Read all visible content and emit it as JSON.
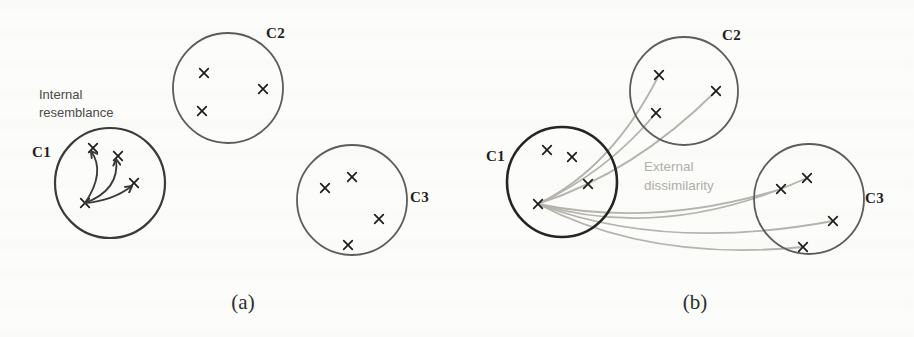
{
  "figure": {
    "background": "#fcfcfa",
    "mark_color": "#1c1c1c",
    "arrow_color": "#3a3a3a",
    "curve_color": "#b5b3ad",
    "panels": [
      {
        "id": "a",
        "caption": "(a)",
        "annotation": {
          "line1": "Internal",
          "line2": "resemblance"
        },
        "clusters": [
          {
            "label": "C1",
            "cx": 110,
            "cy": 183,
            "r": 55,
            "stroke": "#3a3a3a",
            "width": 2.2,
            "points": [
              [
                93,
                148
              ],
              [
                118,
                156
              ],
              [
                134,
                183
              ],
              [
                85,
                203
              ]
            ]
          },
          {
            "label": "C2",
            "cx": 228,
            "cy": 88,
            "r": 55,
            "stroke": "#5c5c5c",
            "width": 1.8,
            "points": [
              [
                204,
                73
              ],
              [
                263,
                89
              ],
              [
                202,
                111
              ]
            ]
          },
          {
            "label": "C3",
            "cx": 352,
            "cy": 200,
            "r": 55,
            "stroke": "#5c5c5c",
            "width": 1.8,
            "points": [
              [
                352,
                177
              ],
              [
                325,
                188
              ],
              [
                379,
                219
              ],
              [
                348,
                245
              ]
            ]
          }
        ],
        "arrows": {
          "from": [
            85,
            203
          ],
          "to": [
            {
              "end": [
                93,
                148
              ],
              "ctrl": [
                106,
                172
              ]
            },
            {
              "end": [
                118,
                156
              ],
              "ctrl": [
                120,
                190
              ]
            },
            {
              "end": [
                134,
                183
              ],
              "ctrl": [
                112,
                201
              ]
            }
          ]
        }
      },
      {
        "id": "b",
        "caption": "(b)",
        "annotation": {
          "line1": "External",
          "line2": "dissimilarity"
        },
        "clusters": [
          {
            "label": "C1",
            "cx": 562,
            "cy": 182,
            "r": 55,
            "stroke": "#252525",
            "width": 2.6,
            "points": [
              [
                547,
                150
              ],
              [
                572,
                157
              ],
              [
                588,
                184
              ],
              [
                538,
                204
              ]
            ]
          },
          {
            "label": "C2",
            "cx": 684,
            "cy": 91,
            "r": 54,
            "stroke": "#5c5c5c",
            "width": 1.8,
            "points": [
              [
                659,
                75
              ],
              [
                716,
                91
              ],
              [
                656,
                113
              ]
            ]
          },
          {
            "label": "C3",
            "cx": 809,
            "cy": 199,
            "r": 55,
            "stroke": "#5c5c5c",
            "width": 1.8,
            "points": [
              [
                807,
                178
              ],
              [
                781,
                189
              ],
              [
                833,
                221
              ],
              [
                803,
                247
              ]
            ]
          }
        ],
        "curves": {
          "from": [
            538,
            204
          ],
          "to": [
            {
              "end": [
                659,
                75
              ],
              "ctrl": [
                612,
                168
              ]
            },
            {
              "end": [
                656,
                113
              ],
              "ctrl": [
                607,
                172
              ]
            },
            {
              "end": [
                716,
                91
              ],
              "ctrl": [
                635,
                172
              ]
            },
            {
              "end": [
                781,
                189
              ],
              "ctrl": [
                655,
                228
              ]
            },
            {
              "end": [
                807,
                178
              ],
              "ctrl": [
                665,
                242
              ]
            },
            {
              "end": [
                833,
                221
              ],
              "ctrl": [
                665,
                252
              ]
            },
            {
              "end": [
                803,
                247
              ],
              "ctrl": [
                650,
                262
              ]
            }
          ]
        }
      }
    ]
  }
}
